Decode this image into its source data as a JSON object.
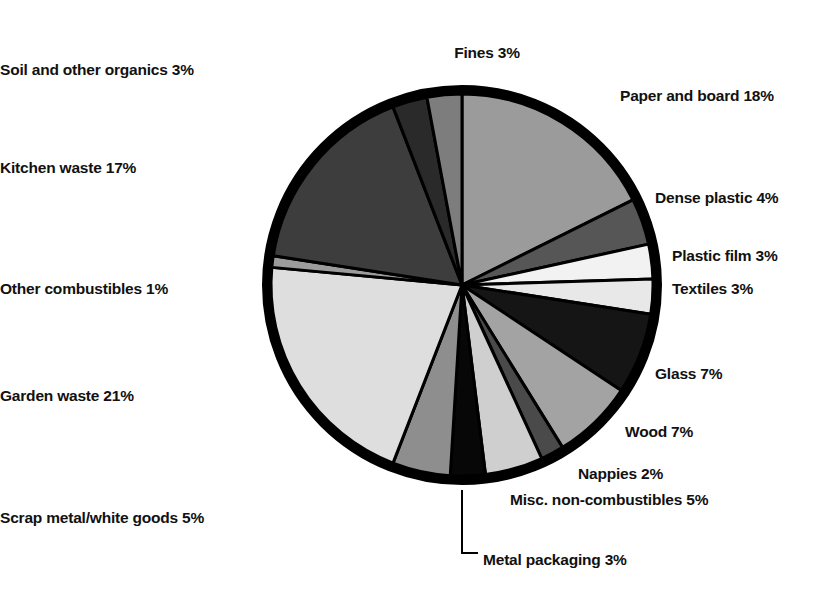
{
  "chart_data": {
    "type": "pie",
    "title": "",
    "subtitle": "",
    "xlabel": "",
    "ylabel": "",
    "units": "percent",
    "legend_position": "outside-labels",
    "grid": false,
    "total": 100,
    "start_angle_deg": 0,
    "direction": "clockwise",
    "categories": [
      "Paper and board",
      "Dense plastic",
      "Plastic film",
      "Textiles",
      "Glass",
      "Wood",
      "Nappies",
      "Misc. non-combustibles",
      "Metal packaging",
      "Scrap metal/white goods",
      "Garden waste",
      "Other combustibles",
      "Kitchen waste",
      "Soil and other organics",
      "Fines"
    ],
    "values": [
      18,
      4,
      3,
      3,
      7,
      7,
      2,
      5,
      3,
      5,
      21,
      1,
      17,
      3,
      3
    ],
    "colors": [
      "#9b9b9b",
      "#565656",
      "#f2f2f2",
      "#e8e8e8",
      "#151515",
      "#a3a3a3",
      "#4a4a4a",
      "#cfcfcf",
      "#070707",
      "#8e8e8e",
      "#dedede",
      "#9c9c9c",
      "#3d3d3d",
      "#2a2a2a",
      "#7d7d7d"
    ],
    "slices": [
      {
        "label": "Paper and board",
        "value": 18,
        "display": "Paper and board 18%",
        "color": "#9b9b9b"
      },
      {
        "label": "Dense plastic",
        "value": 4,
        "display": "Dense plastic 4%",
        "color": "#565656"
      },
      {
        "label": "Plastic film",
        "value": 3,
        "display": "Plastic film 3%",
        "color": "#f2f2f2"
      },
      {
        "label": "Textiles",
        "value": 3,
        "display": "Textiles 3%",
        "color": "#e8e8e8"
      },
      {
        "label": "Glass",
        "value": 7,
        "display": "Glass 7%",
        "color": "#151515"
      },
      {
        "label": "Wood",
        "value": 7,
        "display": "Wood 7%",
        "color": "#a3a3a3"
      },
      {
        "label": "Nappies",
        "value": 2,
        "display": "Nappies 2%",
        "color": "#4a4a4a"
      },
      {
        "label": "Misc. non-combustibles",
        "value": 5,
        "display": "Misc. non-combustibles 5%",
        "color": "#cfcfcf"
      },
      {
        "label": "Metal packaging",
        "value": 3,
        "display": "Metal packaging 3%",
        "color": "#070707"
      },
      {
        "label": "Scrap metal/white goods",
        "value": 5,
        "display": "Scrap metal/white goods 5%",
        "color": "#8e8e8e"
      },
      {
        "label": "Garden waste",
        "value": 21,
        "display": "Garden waste 21%",
        "color": "#dedede"
      },
      {
        "label": "Other combustibles",
        "value": 1,
        "display": "Other combustibles 1%",
        "color": "#9c9c9c"
      },
      {
        "label": "Kitchen waste",
        "value": 17,
        "display": "Kitchen waste 17%",
        "color": "#3d3d3d"
      },
      {
        "label": "Soil and other organics",
        "value": 3,
        "display": "Soil and other organics 3%",
        "color": "#2a2a2a"
      },
      {
        "label": "Fines",
        "value": 3,
        "display": "Fines 3%",
        "color": "#7d7d7d"
      }
    ]
  },
  "geometry": {
    "cx": 462,
    "cy": 285,
    "radius": 200,
    "ring_width": 9,
    "ring_color": "#000000",
    "separator_color": "#000000",
    "separator_width": 3,
    "background": "#ffffff"
  },
  "labels": [
    {
      "key": "fines",
      "text": "Fines 3%",
      "x": 487,
      "y": 45,
      "align": "center"
    },
    {
      "key": "soil",
      "text": "Soil and other organics 3%",
      "x": 398,
      "y": 62,
      "align": "right"
    },
    {
      "key": "paper",
      "text": "Paper and board 18%",
      "x": 620,
      "y": 88,
      "align": "left"
    },
    {
      "key": "kitchen",
      "text": "Kitchen waste 17%",
      "x": 262,
      "y": 160,
      "align": "right"
    },
    {
      "key": "dense-plastic",
      "text": "Dense plastic 4%",
      "x": 655,
      "y": 190,
      "align": "left"
    },
    {
      "key": "plastic-film",
      "text": "Plastic film 3%",
      "x": 672,
      "y": 248,
      "align": "left"
    },
    {
      "key": "textiles",
      "text": "Textiles 3%",
      "x": 672,
      "y": 281,
      "align": "left"
    },
    {
      "key": "other-comb",
      "text": "Other combustibles 1%",
      "x": 248,
      "y": 281,
      "align": "right"
    },
    {
      "key": "glass",
      "text": "Glass 7%",
      "x": 655,
      "y": 366,
      "align": "left"
    },
    {
      "key": "garden",
      "text": "Garden waste 21%",
      "x": 272,
      "y": 388,
      "align": "right"
    },
    {
      "key": "wood",
      "text": "Wood 7%",
      "x": 625,
      "y": 424,
      "align": "left"
    },
    {
      "key": "nappies",
      "text": "Nappies 2%",
      "x": 578,
      "y": 466,
      "align": "left"
    },
    {
      "key": "misc-noncomb",
      "text": "Misc. non-combustibles 5%",
      "x": 510,
      "y": 492,
      "align": "left"
    },
    {
      "key": "scrap-metal",
      "text": "Scrap metal/white goods 5%",
      "x": 440,
      "y": 510,
      "align": "right"
    },
    {
      "key": "metal-packaging",
      "text": "Metal packaging 3%",
      "x": 483,
      "y": 552,
      "align": "left"
    }
  ],
  "leader_line": {
    "name": "metal-packaging-leader",
    "from_x": 462,
    "from_y": 490,
    "to_x": 462,
    "to_y": 553,
    "elbow_x": 478,
    "elbow_y": 553,
    "color": "#000000",
    "width": 2
  }
}
